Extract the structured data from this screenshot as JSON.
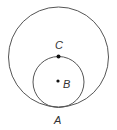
{
  "diagram": {
    "outer_circle": {
      "cx": 58.5,
      "cy": 57,
      "r": 50,
      "stroke": "#555555"
    },
    "inner_circle": {
      "cx": 58.5,
      "cy": 82,
      "r": 25.5,
      "stroke": "#555555"
    },
    "points": [
      {
        "id": "C",
        "label": "C",
        "x": 58.5,
        "y": 56.5,
        "dot": true,
        "label_x": 55,
        "label_y": 49
      },
      {
        "id": "B",
        "label": "B",
        "x": 58,
        "y": 81,
        "dot": true,
        "label_x": 63,
        "label_y": 88
      },
      {
        "id": "A",
        "label": "A",
        "x": 58.5,
        "y": 107,
        "dot": false,
        "label_x": 54,
        "label_y": 124
      }
    ]
  }
}
